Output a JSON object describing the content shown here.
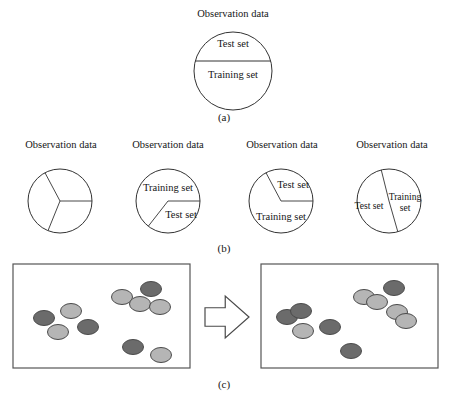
{
  "figure": {
    "title_alt": "Observation data partitioning into training and test sets",
    "captions": {
      "a": "(a)",
      "b": "(b)",
      "c": "(c)"
    },
    "labels": {
      "observation_data": "Observation data",
      "test_set": "Test set",
      "training_set": "Training set",
      "training_word": "Training",
      "set_word": "set"
    },
    "colors": {
      "stroke": "#333333",
      "panel_border": "#555555",
      "dark_marker": "#6b6b6b",
      "light_marker": "#b5b5b5",
      "marker_outline": "#4a4a4a",
      "background": "#ffffff"
    }
  },
  "panel_a": {
    "caption": "(a)",
    "observation_label": "Observation data",
    "circle": {
      "cx": 233,
      "cy": 71,
      "r": 39
    },
    "divider_y": 61,
    "regions": [
      {
        "name": "test-set",
        "label": "Test set",
        "x": 233,
        "y": 45
      },
      {
        "name": "training-set",
        "label": "Training set",
        "x": 233,
        "y": 76
      }
    ]
  },
  "panel_b": {
    "caption": "(b)",
    "circles": [
      {
        "id": "b1",
        "observation_label": "Observation data",
        "obs_x": 61,
        "obs_y": 143,
        "cx": 60,
        "cy": 201,
        "r": 32,
        "sector_angles_deg": [
          0,
          118,
          248
        ],
        "labels": []
      },
      {
        "id": "b2",
        "observation_label": "Observation data",
        "obs_x": 168,
        "obs_y": 143,
        "cx": 168,
        "cy": 201,
        "r": 32,
        "sector_angles_deg": [
          0,
          232
        ],
        "labels": [
          {
            "name": "training-set",
            "text": "Training set",
            "x": 168,
            "y": 187,
            "size": "normal"
          },
          {
            "name": "test-set",
            "text": "Test set",
            "x": 180,
            "y": 214,
            "size": "normal"
          }
        ]
      },
      {
        "id": "b3",
        "observation_label": "Observation data",
        "obs_x": 282,
        "obs_y": 143,
        "cx": 281,
        "cy": 201,
        "r": 32,
        "sector_angles_deg": [
          0,
          118
        ],
        "labels": [
          {
            "name": "test-set",
            "text": "Test set",
            "x": 292,
            "y": 184,
            "size": "normal"
          },
          {
            "name": "training-set",
            "text": "Training set",
            "x": 281,
            "y": 216,
            "size": "normal"
          }
        ]
      },
      {
        "id": "b4",
        "observation_label": "Observation data",
        "obs_x": 392,
        "obs_y": 143,
        "cx": 389,
        "cy": 201,
        "r": 32,
        "sector_angles_deg": [
          104,
          286
        ],
        "labels": [
          {
            "name": "test-set",
            "text": "Test set",
            "x": 369,
            "y": 206,
            "size": "small"
          },
          {
            "name": "training-set-line1",
            "text": "Training",
            "x": 404,
            "y": 196,
            "size": "small"
          },
          {
            "name": "training-set-line2",
            "text": "set",
            "x": 404,
            "y": 207,
            "size": "small"
          }
        ]
      }
    ]
  },
  "panel_c": {
    "caption": "(c)",
    "left_panel": {
      "name": "before-panel",
      "x": 13,
      "y": 264,
      "width": 177,
      "height": 104,
      "markers": [
        {
          "cx": 44,
          "cy": 318,
          "shade": "dark"
        },
        {
          "cx": 71,
          "cy": 311,
          "shade": "light"
        },
        {
          "cx": 58,
          "cy": 332,
          "shade": "light"
        },
        {
          "cx": 88,
          "cy": 327,
          "shade": "dark"
        },
        {
          "cx": 122,
          "cy": 297,
          "shade": "light"
        },
        {
          "cx": 140,
          "cy": 304,
          "shade": "light"
        },
        {
          "cx": 151,
          "cy": 289,
          "shade": "dark"
        },
        {
          "cx": 160,
          "cy": 307,
          "shade": "light"
        },
        {
          "cx": 133,
          "cy": 347,
          "shade": "dark"
        },
        {
          "cx": 161,
          "cy": 355,
          "shade": "light"
        }
      ]
    },
    "arrow": {
      "name": "transform-arrow",
      "x": 205,
      "y": 296,
      "width": 44,
      "height": 42
    },
    "right_panel": {
      "name": "after-panel",
      "x": 261,
      "y": 264,
      "width": 177,
      "height": 104,
      "markers": [
        {
          "cx": 287,
          "cy": 317,
          "shade": "dark"
        },
        {
          "cx": 301,
          "cy": 311,
          "shade": "dark"
        },
        {
          "cx": 303,
          "cy": 331,
          "shade": "light"
        },
        {
          "cx": 330,
          "cy": 327,
          "shade": "dark"
        },
        {
          "cx": 364,
          "cy": 297,
          "shade": "light"
        },
        {
          "cx": 377,
          "cy": 302,
          "shade": "light"
        },
        {
          "cx": 394,
          "cy": 288,
          "shade": "dark"
        },
        {
          "cx": 397,
          "cy": 312,
          "shade": "light"
        },
        {
          "cx": 406,
          "cy": 321,
          "shade": "light"
        },
        {
          "cx": 351,
          "cy": 351,
          "shade": "dark"
        }
      ]
    }
  }
}
